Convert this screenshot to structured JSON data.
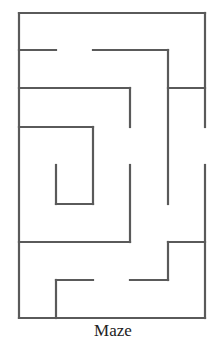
{
  "figure": {
    "caption": "Maze",
    "wall_color": "#5a5a5a",
    "wall_width": 2.2,
    "grid": {
      "x": [
        19,
        56,
        93,
        130,
        168,
        205
      ],
      "y": [
        13,
        50,
        88,
        127,
        165,
        204,
        242,
        280,
        318
      ]
    },
    "walls": [
      [
        19,
        13,
        205,
        13
      ],
      [
        19,
        13,
        19,
        318
      ],
      [
        19,
        318,
        205,
        318
      ],
      [
        205,
        13,
        205,
        127
      ],
      [
        205,
        165,
        205,
        318
      ],
      [
        19,
        50,
        56,
        50
      ],
      [
        93,
        50,
        168,
        50
      ],
      [
        168,
        50,
        168,
        204
      ],
      [
        19,
        88,
        130,
        88
      ],
      [
        168,
        88,
        205,
        88
      ],
      [
        130,
        88,
        130,
        127
      ],
      [
        130,
        165,
        130,
        242
      ],
      [
        19,
        127,
        93,
        127
      ],
      [
        93,
        127,
        93,
        204
      ],
      [
        56,
        165,
        56,
        204
      ],
      [
        56,
        204,
        93,
        204
      ],
      [
        19,
        242,
        130,
        242
      ],
      [
        168,
        242,
        205,
        242
      ],
      [
        168,
        242,
        168,
        280
      ],
      [
        56,
        280,
        93,
        280
      ],
      [
        130,
        280,
        168,
        280
      ],
      [
        56,
        280,
        56,
        318
      ]
    ],
    "openings": [
      {
        "side": "right",
        "y_from": 127,
        "y_to": 165
      }
    ]
  }
}
